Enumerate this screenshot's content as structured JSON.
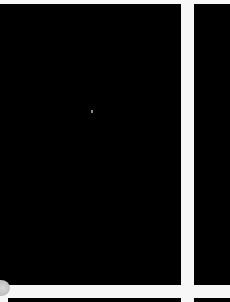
{
  "gallery": {
    "tiles": [
      {
        "id": "main",
        "fill": "#000000"
      },
      {
        "id": "right",
        "fill": "#000000"
      },
      {
        "id": "bottom-left",
        "fill": "#000000"
      },
      {
        "id": "bottom-right",
        "fill": "#000000"
      }
    ],
    "gutter_color": "#f7f7f7"
  }
}
